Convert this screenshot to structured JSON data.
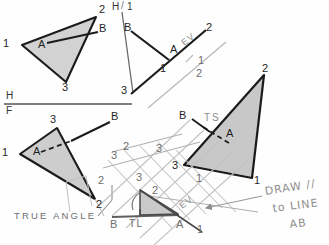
{
  "sheet": {
    "title": "Auxiliary View Construction - Triangle 1-2-3 with Line AB",
    "background_color": "#fefefe",
    "ink_color": "#1f1f1f",
    "construction_color": "#b4b4b4",
    "shade_color": "#cfcfcf"
  },
  "views": {
    "top": {
      "name": "Top View (Horizontal)",
      "vertices": [
        {
          "label": "1",
          "x": 10,
          "y": 44
        },
        {
          "label": "2",
          "x": 99,
          "y": 12
        },
        {
          "label": "3",
          "x": 64,
          "y": 84
        }
      ],
      "points": [
        {
          "label": "A",
          "x": 42,
          "y": 44
        },
        {
          "label": "B",
          "x": 95,
          "y": 31
        }
      ],
      "line_style": "solid"
    },
    "front": {
      "name": "Front View (Frontal)",
      "vertices": [
        {
          "label": "1",
          "x": 8,
          "y": 153
        },
        {
          "label": "3",
          "x": 55,
          "y": 122
        },
        {
          "label": "2",
          "x": 98,
          "y": 203
        }
      ],
      "points": [
        {
          "label": "A",
          "x": 38,
          "y": 152
        },
        {
          "label": "B",
          "x": 115,
          "y": 118
        }
      ],
      "line_style": "dashed"
    },
    "aux1_edge": {
      "name": "Auxiliary View 1 - Edge View",
      "label": "EV",
      "vertices": [
        {
          "label": "3",
          "x": 124,
          "y": 88
        },
        {
          "label": "1",
          "x": 163,
          "y": 64
        },
        {
          "label": "2",
          "x": 208,
          "y": 26
        }
      ],
      "points": [
        {
          "label": "A",
          "x": 178,
          "y": 47
        },
        {
          "label": "B",
          "x": 128,
          "y": 28
        }
      ]
    },
    "aux2_truesize": {
      "name": "Auxiliary View 2 - True Size",
      "label": "TS",
      "vertices": [
        {
          "label": "2",
          "x": 262,
          "y": 72
        },
        {
          "label": "3",
          "x": 180,
          "y": 163
        },
        {
          "label": "1",
          "x": 253,
          "y": 180
        }
      ],
      "points": [
        {
          "label": "A",
          "x": 228,
          "y": 134
        },
        {
          "label": "B",
          "x": 186,
          "y": 117
        }
      ]
    },
    "aux_trueangle": {
      "name": "True Angle / True Length Construction",
      "labels": [
        "TL",
        "B",
        "A",
        "2",
        "3"
      ],
      "tl_label": "TL",
      "note": "TRUE ANGLE"
    }
  },
  "fold_lines": [
    {
      "id": "hf",
      "top": "H",
      "bottom": "F",
      "name": "horizontal-frontal-fold"
    },
    {
      "id": "h1",
      "top": "H",
      "bottom": "1",
      "name": "horizontal-aux1-fold"
    },
    {
      "id": "f12",
      "top": "1",
      "bottom": "2",
      "name": "aux1-aux2-fold"
    },
    {
      "id": "f23",
      "top": "2",
      "bottom": "3",
      "name": "aux2-aux3-fold"
    }
  ],
  "annotations": {
    "true_angle": "TRUE ANGLE",
    "true_size": "TS",
    "edge_view": "EV",
    "true_length": "TL",
    "handwritten": {
      "line1": "DRAW //",
      "line2": "to LINE",
      "line3": "AB"
    }
  },
  "labels": {
    "H": "H",
    "F": "F",
    "one": "1",
    "two": "2",
    "three": "3",
    "A": "A",
    "B": "B"
  }
}
